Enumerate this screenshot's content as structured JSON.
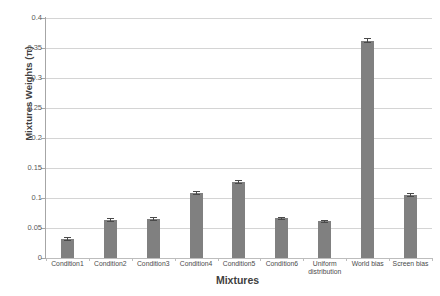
{
  "chart_data": {
    "type": "bar",
    "title": "",
    "xlabel": "Mixtures",
    "ylabel": "Mixtures Weights (π)",
    "categories": [
      "Condition1",
      "Condition2",
      "Condition3",
      "Condition4",
      "Condition5",
      "Condition6",
      "Uniform distribution",
      "World bias",
      "Screen bias"
    ],
    "values": [
      0.032,
      0.063,
      0.065,
      0.108,
      0.127,
      0.066,
      0.061,
      0.362,
      0.105
    ],
    "errors": [
      0.003,
      0.003,
      0.003,
      0.003,
      0.003,
      0.003,
      0.003,
      0.004,
      0.003
    ],
    "ylim": [
      0,
      0.4
    ],
    "yticks": [
      0,
      0.05,
      0.1,
      0.15,
      0.2,
      0.25,
      0.3,
      0.35,
      0.4
    ],
    "ytick_labels": [
      "0",
      "0.05",
      "0.1",
      "0.15",
      "0.2",
      "0.25",
      "0.3",
      "0.35",
      "0.4"
    ],
    "grid": true,
    "legend": false,
    "bar_color": "#808080",
    "gridline_color": "#d4d4d4",
    "axis_color": "#a6a6a6",
    "background": "#ffffff"
  }
}
